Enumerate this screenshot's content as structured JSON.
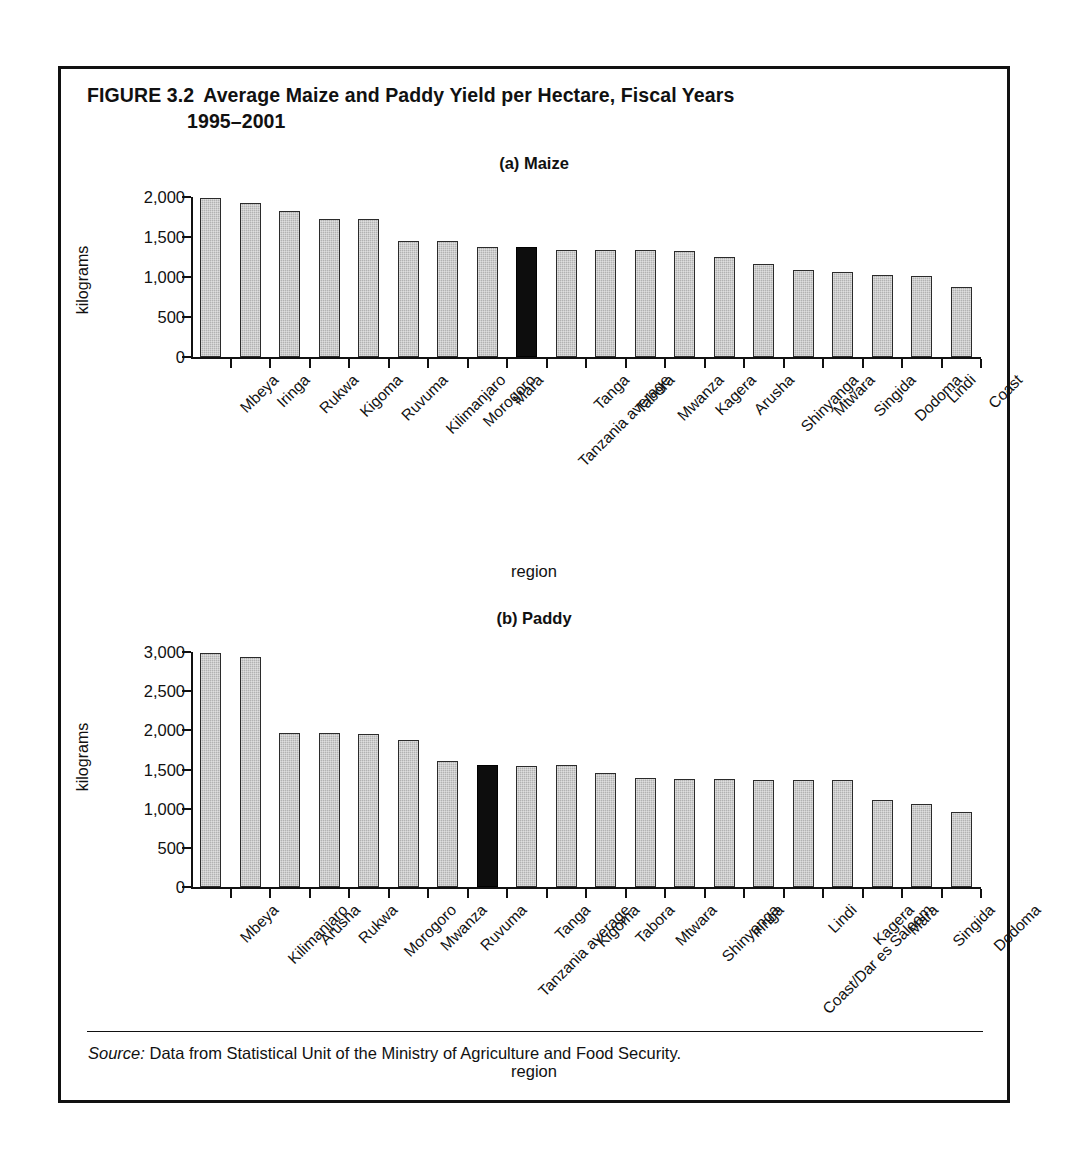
{
  "figure": {
    "number": "FIGURE 3.2",
    "title_line1": "Average Maize and Paddy Yield per Hectare, Fiscal Years",
    "title_line2": "1995–2001",
    "source_word": "Source:",
    "source_text": " Data from Statistical Unit of the Ministry of Agriculture and Food Security."
  },
  "colors": {
    "bar_fill": "#b2b2b2",
    "bar_stroke": "#2b2b2b",
    "highlight_fill": "#0d0d0d",
    "axis": "#111111",
    "background": "#ffffff"
  },
  "panels": {
    "maize": {
      "label": "(a) Maize"
    },
    "paddy": {
      "label": "(b) Paddy"
    }
  },
  "chart_data": [
    {
      "type": "bar",
      "title": "(a) Maize",
      "xlabel": "region",
      "ylabel": "kilograms",
      "ylim": [
        0,
        2000
      ],
      "yticks": [
        0,
        500,
        1000,
        1500,
        2000
      ],
      "ytick_labels": [
        "0",
        "500",
        "1,000",
        "1,500",
        "2,000"
      ],
      "grid": false,
      "legend": "none",
      "highlight_category": "Tanzania average",
      "categories": [
        "Mbeya",
        "Iringa",
        "Rukwa",
        "Kigoma",
        "Ruvuma",
        "Kilimanjaro",
        "Morogoro",
        "Mara",
        "Tanzania average",
        "Tanga",
        "Tabora",
        "Mwanza",
        "Kagera",
        "Arusha",
        "Shinyanga",
        "Mtwara",
        "Singida",
        "Dodoma",
        "Lindi",
        "Coast"
      ],
      "values": [
        1990,
        1920,
        1820,
        1730,
        1730,
        1450,
        1450,
        1380,
        1380,
        1340,
        1335,
        1335,
        1325,
        1250,
        1165,
        1090,
        1065,
        1025,
        1015,
        880
      ]
    },
    {
      "type": "bar",
      "title": "(b) Paddy",
      "xlabel": "region",
      "ylabel": "kilograms",
      "ylim": [
        0,
        3000
      ],
      "yticks": [
        0,
        500,
        1000,
        1500,
        2000,
        2500,
        3000
      ],
      "ytick_labels": [
        "0",
        "500",
        "1,000",
        "1,500",
        "2,000",
        "2,500",
        "3,000"
      ],
      "grid": false,
      "legend": "none",
      "highlight_category": "Tanzania average",
      "categories": [
        "Mbeya",
        "Kilimanjaro",
        "Arusha",
        "Rukwa",
        "Morogoro",
        "Mwanza",
        "Ruvuma",
        "Tanzania average",
        "Tanga",
        "Kigoma",
        "Tabora",
        "Mtwara",
        "Shinyanga",
        "Iringa",
        "Coast/Dar es Salaam",
        "Lindi",
        "Kagera",
        "Mara",
        "Singida",
        "Dodoma"
      ],
      "values": [
        2990,
        2930,
        1970,
        1960,
        1950,
        1880,
        1610,
        1560,
        1545,
        1555,
        1450,
        1390,
        1385,
        1375,
        1365,
        1365,
        1365,
        1110,
        1055,
        955
      ]
    }
  ]
}
